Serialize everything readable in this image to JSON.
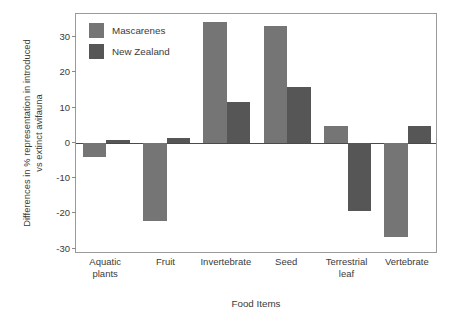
{
  "chart_data": {
    "type": "bar",
    "title": "",
    "subtitle": "",
    "xlabel": "Food Items",
    "ylabel": "Differences in % representation in introduced vs extinct avifauna",
    "ylabel_line1": "Differences in % representation in introduced",
    "ylabel_line2": "vs extinct avifauna",
    "categories": [
      "Aquatic plants",
      "Fruit",
      "Invertebrate",
      "Seed",
      "Terrestrial leaf",
      "Vertebrate"
    ],
    "category_lines": [
      [
        "Aquatic",
        "plants"
      ],
      [
        "Fruit"
      ],
      [
        "Invertebrate"
      ],
      [
        "Seed"
      ],
      [
        "Terrestrial",
        "leaf"
      ],
      [
        "Vertebrate"
      ]
    ],
    "series": [
      {
        "name": "Mascarenes",
        "color": "#757575",
        "values": [
          -4.0,
          -22.2,
          34.2,
          33.1,
          4.9,
          -26.8
        ]
      },
      {
        "name": "New Zealand",
        "color": "#565656",
        "values": [
          0.7,
          1.5,
          11.7,
          15.7,
          -19.2,
          4.7
        ]
      }
    ],
    "ylim": [
      -31.5,
      36.5
    ],
    "yticks": [
      30,
      20,
      10,
      0,
      -10,
      -20,
      -30
    ],
    "ytick_labels": [
      "30",
      "20",
      "10",
      "0",
      "-10",
      "-20",
      "-30"
    ],
    "grid": false,
    "legend_position": "top-left",
    "zero_line": true,
    "frame": true,
    "axis_color": "#9a9a9a",
    "text_color": "#3a3a3a",
    "background": "#ffffff"
  },
  "legend": {
    "entries": [
      {
        "label": "Mascarenes",
        "color": "#757575"
      },
      {
        "label": "New Zealand",
        "color": "#565656"
      }
    ]
  }
}
